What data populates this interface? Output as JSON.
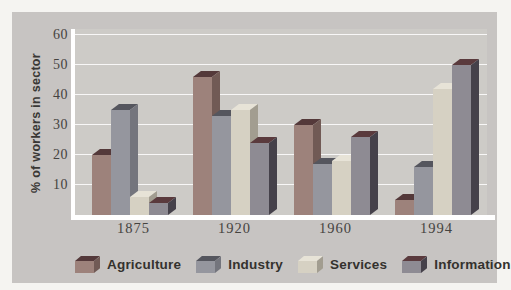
{
  "figure": {
    "y_axis_title": "% of workers in sector"
  },
  "chart_data": {
    "type": "bar",
    "style": "3d-bars",
    "title": "",
    "xlabel": "",
    "ylabel": "% of workers in sector",
    "ylim": [
      0,
      60
    ],
    "y_ticks": [
      60,
      50,
      40,
      30,
      20,
      10
    ],
    "grid": true,
    "legend_position": "bottom",
    "categories": [
      "1875",
      "1920",
      "1960",
      "1994"
    ],
    "series": [
      {
        "name": "Agriculture",
        "values": [
          20,
          46,
          30,
          5
        ],
        "colors": {
          "front": "#9d827b",
          "top": "#54393a",
          "side": "#715a55"
        }
      },
      {
        "name": "Industry",
        "values": [
          35,
          33,
          17,
          16
        ],
        "colors": {
          "front": "#95969e",
          "top": "#55565e",
          "side": "#74757d"
        }
      },
      {
        "name": "Services",
        "values": [
          6,
          35,
          18,
          42
        ],
        "colors": {
          "front": "#d6d1c3",
          "top": "#e7e3d7",
          "side": "#a29d90"
        }
      },
      {
        "name": "Information",
        "values": [
          4,
          24,
          26,
          50
        ],
        "colors": {
          "front": "#8e8b93",
          "top": "#5a3a3d",
          "side": "#45414a"
        }
      }
    ]
  },
  "colors": {
    "page_bg": "#f5f4f1",
    "panel_bg": "#c7c4c2",
    "plot_bg": "#cdcbc7",
    "grid_line": "#ffffff",
    "axis_line": "#ffffff",
    "tick_text": "#45433f",
    "legend_text": "#34322e"
  }
}
